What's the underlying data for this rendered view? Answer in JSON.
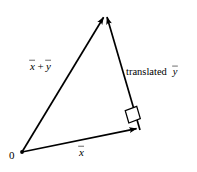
{
  "figure": {
    "background_color": "#ffffff",
    "stroke_color": "#000000",
    "width": 197,
    "height": 172
  },
  "labels": {
    "origin": "0",
    "sum_first_term": "x",
    "sum_operator": "+",
    "sum_second_term": "y",
    "base_vector": "x",
    "translated_word": "translated",
    "translated_vector": "y"
  },
  "geometry": {
    "points": {
      "origin": {
        "x": 22,
        "y": 152
      },
      "apex": {
        "x": 106,
        "y": 13
      },
      "right_vertex": {
        "x": 140,
        "y": 130
      }
    },
    "right_angle_marker": {
      "at": "right_vertex",
      "size": 13
    }
  },
  "edges": [
    {
      "name": "vector-x",
      "from": "origin",
      "to": "right_vertex",
      "arrowhead": "to",
      "label": "x"
    },
    {
      "name": "vector-translated-y",
      "from": "right_vertex",
      "to": "apex",
      "arrowhead": "to",
      "label": "translated y"
    },
    {
      "name": "vector-x-plus-y",
      "from": "origin",
      "to": "apex",
      "arrowhead": "to",
      "label": "x + y"
    }
  ]
}
